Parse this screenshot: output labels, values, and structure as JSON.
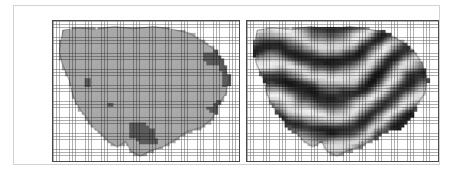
{
  "figure": {
    "title": "",
    "background_color": "#ffffff",
    "frame_color": "#d2d2d2",
    "panel_border_color": "#4a4a4a",
    "panel_count": 2,
    "grid_overlay": true,
    "grid_cell_px": 3.2,
    "grid_line_color": "#6e6e6e"
  },
  "panels": [
    {
      "id": "left",
      "name": "classified-raster-panel",
      "caption": "",
      "raster_type": "classified",
      "background_color": "#ffffff",
      "class_count": 2,
      "classes": [
        {
          "label": "",
          "color": "#a9a9a9"
        },
        {
          "label": "",
          "color": "#5c5c5c"
        }
      ],
      "boundary_outline": true
    },
    {
      "id": "right",
      "name": "continuous-raster-panel",
      "caption": "",
      "raster_type": "continuous-grayscale",
      "background_color": "#ffffff",
      "value_range_colors": {
        "low": "#1e1e1e",
        "high": "#f0f0f0"
      },
      "pattern": "ridge-and-valley-banding",
      "boundary_outline": true
    }
  ],
  "chart_data": {
    "type": "heatmap",
    "title": "",
    "subtitle": "",
    "xlabel": "",
    "ylabel": "",
    "grid": true,
    "legend": "none",
    "panels": [
      {
        "name": "classified-raster",
        "ncols": 58,
        "nrows": 44,
        "nodata_color": "#ffffff",
        "palette": [
          "#ffffff",
          "#a9a9a9",
          "#5c5c5c"
        ],
        "palette_labels": [
          "nodata",
          "class-1",
          "class-2"
        ],
        "description": "Discrete two-class classified raster clipped to an irregular polygon boundary."
      },
      {
        "name": "continuous-raster",
        "ncols": 60,
        "nrows": 44,
        "nodata_color": "#ffffff",
        "colormap": "grayscale",
        "vmin": 0,
        "vmax": 1,
        "description": "Continuous grayscale surface with diagonal ridge-and-valley banding clipped to the same polygon boundary."
      }
    ]
  }
}
